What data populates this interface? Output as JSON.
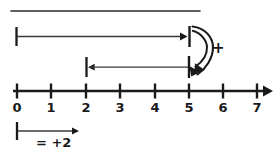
{
  "diagram": {
    "ink_color": "#1a1a1a",
    "background_color": "#ffffff",
    "top_rule": {
      "x1": 11,
      "x2": 200,
      "y": 11
    },
    "number_line": {
      "y": 91,
      "x_start": 13,
      "x_end": 272,
      "tick_spacing": 34.3,
      "tick_origin_x": 17,
      "tick_height": 9,
      "has_right_arrowhead": true,
      "labels": [
        "0",
        "1",
        "2",
        "3",
        "4",
        "5",
        "6",
        "7"
      ],
      "label_values": [
        0,
        1,
        2,
        3,
        4,
        5,
        6,
        7
      ],
      "label_y": 101
    },
    "jump_arrows": [
      {
        "name": "upper-jump-arrow",
        "from_value": 0,
        "to_value": 5,
        "length_value": 5,
        "y": 36,
        "start_cap": "tick",
        "end_cap": "arrowhead-plus-tick"
      },
      {
        "name": "lower-jump-arrow",
        "from_value": 2,
        "to_value": 5,
        "length_value": 3,
        "y": 67,
        "start_cap": "tick-with-left-arrowhead",
        "end_cap": "tick"
      }
    ],
    "curved_arrow": {
      "name": "curved-hook-arrow",
      "description": "hand drawn curved hook sweeping from upper tick down to lower tick",
      "direction": "downward-curving-left"
    },
    "plus_sign": {
      "label": "+",
      "x": 212,
      "y": 41
    },
    "legend": {
      "name": "unit-arrow-legend",
      "arrow": {
        "x1": 17,
        "x2": 79,
        "y": 131,
        "length_value": 2
      },
      "label": "= +2",
      "label_x": 36,
      "label_y": 136
    }
  }
}
